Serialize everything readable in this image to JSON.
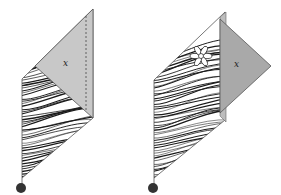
{
  "figure": {
    "panels": [
      {
        "id": "left",
        "flap_label": "x",
        "flap_state": "folded-over, covering the top of the patterned strip",
        "hinge_line": "dashed"
      },
      {
        "id": "right",
        "flap_label": "x",
        "flap_state": "unfolded to the right, revealing a flower motif",
        "hinge_line": "solid"
      }
    ],
    "colors": {
      "flap": "#c8c8c8",
      "flap_dark": "#a9a9a9",
      "outline": "#555555",
      "ink": "#1a1a1a",
      "dot": "#333333"
    }
  }
}
